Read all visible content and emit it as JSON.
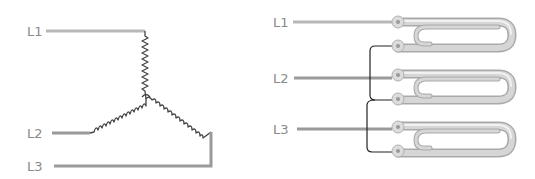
{
  "left_diagram": {
    "title": "Star (wye) connection schematic",
    "labels": {
      "l1": "L1",
      "l2": "L2",
      "l3": "L3"
    },
    "colors": {
      "lead": "#b8b8b8",
      "coil": "#444444",
      "label": "#8a8a8a"
    }
  },
  "right_diagram": {
    "title": "Tubular heater elements wired in star",
    "labels": {
      "l1": "L1",
      "l2": "L2",
      "l3": "L3"
    },
    "elements": [
      {
        "name": "element-1",
        "terminals": [
          "L1",
          "jumper"
        ]
      },
      {
        "name": "element-2",
        "terminals": [
          "L2",
          "jumper"
        ]
      },
      {
        "name": "element-3",
        "terminals": [
          "L3",
          "jumper"
        ]
      }
    ],
    "colors": {
      "tube": "#c8c8c8",
      "jumper": "#222222",
      "label": "#8a8a8a"
    }
  }
}
